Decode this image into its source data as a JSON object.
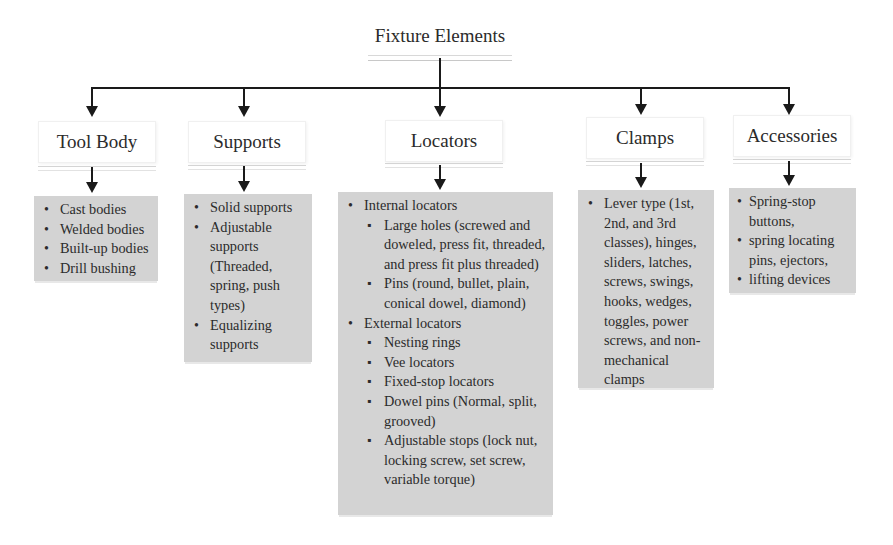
{
  "diagram": {
    "title": "Fixture Elements",
    "categories": [
      {
        "id": "tool-body",
        "label": "Tool Body",
        "items": [
          "Cast bodies",
          "Welded bodies",
          "Built-up bodies",
          "Drill bushing"
        ]
      },
      {
        "id": "supports",
        "label": "Supports",
        "items": [
          "Solid supports",
          "Adjustable supports (Threaded, spring, push types)",
          "Equalizing supports"
        ]
      },
      {
        "id": "locators",
        "label": "Locators",
        "groups": [
          {
            "label": "Internal locators",
            "items": [
              "Large holes (screwed and doweled, press fit, threaded, and press fit plus threaded)",
              "Pins (round, bullet, plain, conical dowel, diamond)"
            ]
          },
          {
            "label": "External locators",
            "items": [
              "Nesting rings",
              "Vee locators",
              "Fixed-stop locators",
              "Dowel pins  (Normal, split, grooved)",
              "Adjustable stops (lock nut, locking screw, set screw, variable torque)"
            ]
          }
        ]
      },
      {
        "id": "clamps",
        "label": "Clamps",
        "items": [
          "Lever type (1st, 2nd, and 3rd classes), hinges, sliders, latches, screws, swings, hooks, wedges, toggles, power screws, and non-mechanical clamps"
        ]
      },
      {
        "id": "accessories",
        "label": "Accessories",
        "items": [
          "Spring-stop buttons,",
          "spring locating pins, ejectors,",
          "lifting devices"
        ]
      }
    ],
    "colors": {
      "content_box_fill": "#d3d3d3",
      "connector": "#1a1a1a",
      "header_fill": "#ffffff"
    }
  }
}
